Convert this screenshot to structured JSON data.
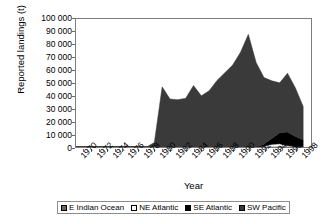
{
  "chart_data": {
    "type": "area",
    "stacked": true,
    "title": "",
    "xlabel": "Year",
    "ylabel": "Reported landings (t)",
    "xlim": [
      1969,
      1999
    ],
    "ylim": [
      0,
      100000
    ],
    "ytick_labels": [
      "100 000",
      "90 000",
      "80 000",
      "70 000",
      "60 000",
      "50 000",
      "40 000",
      "30 000",
      "20 000",
      "10 000",
      "0"
    ],
    "ytick_values": [
      100000,
      90000,
      80000,
      70000,
      60000,
      50000,
      40000,
      30000,
      20000,
      10000,
      0
    ],
    "xtick_labels": [
      "1970",
      "1972",
      "1974",
      "1976",
      "1978",
      "1980",
      "1982",
      "1984",
      "1986",
      "1988",
      "1990",
      "1992",
      "1994",
      "1996",
      "1998"
    ],
    "xtick_values": [
      1970,
      1972,
      1974,
      1976,
      1978,
      1980,
      1982,
      1984,
      1986,
      1988,
      1990,
      1992,
      1994,
      1996,
      1998
    ],
    "grid": false,
    "legend_position": "bottom",
    "x": [
      1969,
      1970,
      1971,
      1972,
      1973,
      1974,
      1975,
      1976,
      1977,
      1978,
      1979,
      1980,
      1981,
      1982,
      1983,
      1984,
      1985,
      1986,
      1987,
      1988,
      1989,
      1990,
      1991,
      1992,
      1993,
      1994,
      1995,
      1996,
      1997,
      1998
    ],
    "series": [
      {
        "name": "E Indian Ocean",
        "color": "#666666",
        "values": [
          0,
          0,
          0,
          0,
          0,
          0,
          0,
          0,
          0,
          0,
          0,
          0,
          0,
          0,
          0,
          0,
          0,
          0,
          0,
          0,
          0,
          0,
          0,
          0,
          0,
          0,
          0,
          0,
          0,
          0
        ]
      },
      {
        "name": "NE Atlantic",
        "color": "#ffffff",
        "values": [
          0,
          0,
          0,
          0,
          0,
          0,
          0,
          0,
          0,
          0,
          0,
          0,
          0,
          0,
          0,
          0,
          0,
          0,
          0,
          0,
          0,
          0,
          0,
          0,
          700,
          2200,
          2600,
          1200,
          300,
          200
        ]
      },
      {
        "name": "SE Atlantic",
        "color": "#000000",
        "values": [
          0,
          0,
          0,
          0,
          0,
          0,
          0,
          0,
          0,
          0,
          0,
          0,
          0,
          0,
          0,
          0,
          0,
          0,
          0,
          0,
          0,
          0,
          0,
          0,
          1500,
          4500,
          8500,
          10500,
          8000,
          5500
        ]
      },
      {
        "name": "SW Pacific",
        "color": "#3a3a3a",
        "values": [
          0,
          0,
          0,
          0,
          0,
          0,
          0,
          0,
          0,
          0,
          3500,
          47000,
          37500,
          37000,
          38000,
          48000,
          40000,
          44000,
          52000,
          58000,
          64000,
          74000,
          88000,
          66000,
          52000,
          45000,
          39000,
          46000,
          38000,
          26000
        ]
      }
    ]
  },
  "legend": {
    "items": [
      {
        "label": "E Indian Ocean",
        "color": "#666666"
      },
      {
        "label": "NE Atlantic",
        "color": "#ffffff"
      },
      {
        "label": "SE Atlantic",
        "color": "#000000"
      },
      {
        "label": "SW Pacific",
        "color": "#3a3a3a"
      }
    ]
  }
}
